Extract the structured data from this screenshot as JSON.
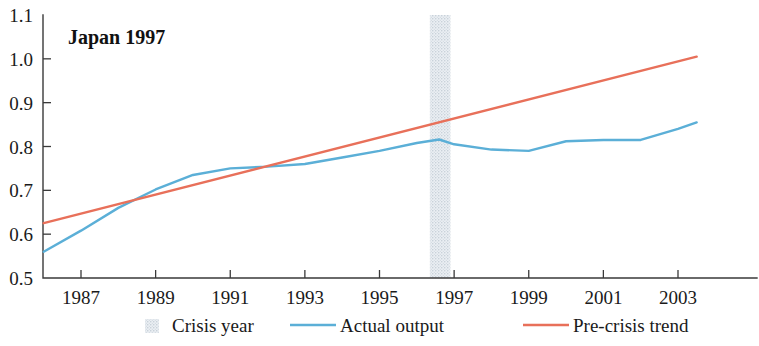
{
  "chart_data": {
    "type": "line",
    "title": "Japan 1997",
    "xlabel": "",
    "ylabel": "",
    "xlim": [
      1986,
      2003.6
    ],
    "ylim": [
      0.5,
      1.1
    ],
    "grid": false,
    "legend_position": "bottom",
    "ytick_labels": [
      "1.1",
      "1.0",
      "0.9",
      "0.8",
      "0.7",
      "0.6",
      "0.5"
    ],
    "ytick_values": [
      1.1,
      1.0,
      0.9,
      0.8,
      0.7,
      0.6,
      0.5
    ],
    "xtick_labels": [
      "1987",
      "1989",
      "1991",
      "1993",
      "1995",
      "1997",
      "1999",
      "2001",
      "2003"
    ],
    "xtick_values": [
      1987,
      1989,
      1991,
      1993,
      1995,
      1997,
      1999,
      2001,
      2003
    ],
    "crisis_year": 1996.6,
    "crisis_band": [
      1996.35,
      1996.9
    ],
    "colors": {
      "actual_output": "#5BAFD7",
      "pre_crisis_trend": "#E8705A",
      "crisis_band": "#D8DEE4",
      "axis": "#3a3a3a",
      "text": "#1a1a1a"
    },
    "series": [
      {
        "name": "Actual output",
        "color": "#5BAFD7",
        "x": [
          1986.0,
          1987.0,
          1988.0,
          1989.0,
          1990.0,
          1991.0,
          1992.0,
          1993.0,
          1994.0,
          1995.0,
          1996.0,
          1996.6,
          1997.0,
          1998.0,
          1999.0,
          2000.0,
          2001.0,
          2002.0,
          2003.0,
          2003.5
        ],
        "values": [
          0.56,
          0.608,
          0.66,
          0.702,
          0.735,
          0.75,
          0.754,
          0.76,
          0.775,
          0.79,
          0.808,
          0.816,
          0.805,
          0.793,
          0.79,
          0.812,
          0.815,
          0.815,
          0.84,
          0.855
        ]
      },
      {
        "name": "Pre-crisis trend",
        "color": "#E8705A",
        "x": [
          1986.0,
          2003.5
        ],
        "values": [
          0.625,
          1.005
        ]
      }
    ],
    "legend": [
      {
        "label": "Crisis year",
        "marker": "shaded-band",
        "color": "#D8DEE4"
      },
      {
        "label": "Actual output",
        "marker": "line",
        "color": "#5BAFD7"
      },
      {
        "label": "Pre-crisis trend",
        "marker": "line",
        "color": "#E8705A"
      }
    ]
  }
}
